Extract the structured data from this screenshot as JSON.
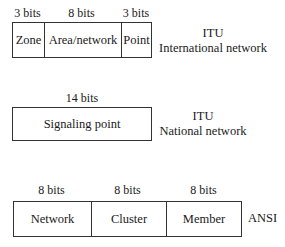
{
  "itu_international": {
    "fields": [
      {
        "bits": "3 bits",
        "name": "Zone"
      },
      {
        "bits": "8 bits",
        "name": "Area/network"
      },
      {
        "bits": "3 bits",
        "name": "Point"
      }
    ],
    "label_line1": "ITU",
    "label_line2": "International network"
  },
  "itu_national": {
    "fields": [
      {
        "bits": "14 bits",
        "name": "Signaling point"
      }
    ],
    "label_line1": "ITU",
    "label_line2": "National network"
  },
  "ansi": {
    "fields": [
      {
        "bits": "8 bits",
        "name": "Network"
      },
      {
        "bits": "8 bits",
        "name": "Cluster"
      },
      {
        "bits": "8 bits",
        "name": "Member"
      }
    ],
    "label": "ANSI"
  }
}
